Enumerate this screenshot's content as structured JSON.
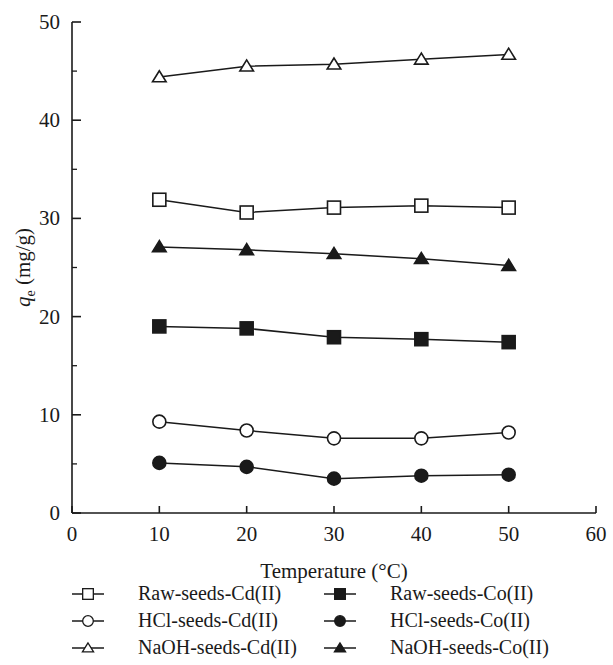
{
  "chart_data": {
    "type": "line",
    "title": "",
    "xlabel": "Temperature (°C)",
    "ylabel": "q_e (mg/g)",
    "ylabel_base": "q",
    "ylabel_sub": "e",
    "ylabel_unit": " (mg/g)",
    "x": [
      10,
      20,
      30,
      40,
      50
    ],
    "xlim": [
      0,
      60
    ],
    "ylim": [
      0,
      50
    ],
    "xticks": [
      "0",
      "10",
      "20",
      "30",
      "40",
      "50",
      "60"
    ],
    "xtick_values": [
      0,
      10,
      20,
      30,
      40,
      50,
      60
    ],
    "yticks": [
      "0",
      "10",
      "20",
      "30",
      "40",
      "50"
    ],
    "ytick_values": [
      0,
      10,
      20,
      30,
      40,
      50
    ],
    "y_minor_ticks": [
      5,
      15,
      25,
      35,
      45
    ],
    "grid": false,
    "legend_position": "below-plot-two-columns",
    "line_color": "#1a1a1a",
    "series": [
      {
        "name": "NaOH-seeds-Cd(II)",
        "marker": "triangle-open",
        "filled": false,
        "values": [
          44.4,
          45.5,
          45.7,
          46.2,
          46.7
        ]
      },
      {
        "name": "Raw-seeds-Cd(II)",
        "marker": "square-open",
        "filled": false,
        "values": [
          31.9,
          30.6,
          31.1,
          31.3,
          31.1
        ]
      },
      {
        "name": "NaOH-seeds-Co(II)",
        "marker": "triangle-filled",
        "filled": true,
        "values": [
          27.1,
          26.8,
          26.4,
          25.9,
          25.2
        ]
      },
      {
        "name": "Raw-seeds-Co(II)",
        "marker": "square-filled",
        "filled": true,
        "values": [
          19.0,
          18.8,
          17.9,
          17.7,
          17.4
        ]
      },
      {
        "name": "HCl-seeds-Cd(II)",
        "marker": "circle-open",
        "filled": false,
        "values": [
          9.3,
          8.4,
          7.6,
          7.6,
          8.2
        ]
      },
      {
        "name": "HCl-seeds-Co(II)",
        "marker": "circle-filled",
        "filled": true,
        "values": [
          5.1,
          4.7,
          3.5,
          3.8,
          3.9
        ]
      }
    ]
  },
  "legend": {
    "left_column": [
      {
        "label": "Raw-seeds-Cd(II)",
        "marker": "square-open"
      },
      {
        "label": "HCl-seeds-Cd(II)",
        "marker": "circle-open"
      },
      {
        "label": "NaOH-seeds-Cd(II)",
        "marker": "triangle-open"
      }
    ],
    "right_column": [
      {
        "label": "Raw-seeds-Co(II)",
        "marker": "square-filled"
      },
      {
        "label": "HCl-seeds-Co(II)",
        "marker": "circle-filled"
      },
      {
        "label": "NaOH-seeds-Co(II)",
        "marker": "triangle-filled"
      }
    ]
  }
}
